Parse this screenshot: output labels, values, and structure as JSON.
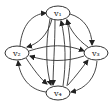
{
  "diagram": {
    "type": "directed-graph",
    "nodes": [
      {
        "id": "v1",
        "label": "v₁",
        "cx": 58,
        "cy": 13
      },
      {
        "id": "v2",
        "label": "v₂",
        "cx": 17,
        "cy": 53
      },
      {
        "id": "v3",
        "label": "v₃",
        "cx": 96,
        "cy": 53
      },
      {
        "id": "v4",
        "label": "v₄",
        "cx": 58,
        "cy": 93
      }
    ],
    "edges": [
      {
        "from": "v2",
        "to": "v1"
      },
      {
        "from": "v1",
        "to": "v2"
      },
      {
        "from": "v1",
        "to": "v3"
      },
      {
        "from": "v3",
        "to": "v1"
      },
      {
        "from": "v2",
        "to": "v3"
      },
      {
        "from": "v3",
        "to": "v2"
      },
      {
        "from": "v1",
        "to": "v4"
      },
      {
        "from": "v4",
        "to": "v1"
      },
      {
        "from": "v2",
        "to": "v4"
      },
      {
        "from": "v4",
        "to": "v2"
      },
      {
        "from": "v4",
        "to": "v3"
      },
      {
        "from": "v3",
        "to": "v4"
      }
    ]
  }
}
